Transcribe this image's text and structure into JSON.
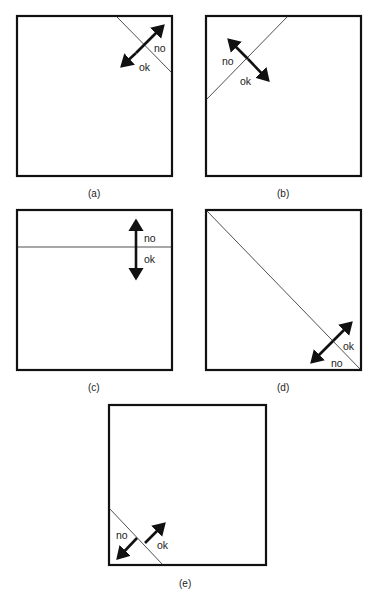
{
  "figure": {
    "panels": [
      {
        "id": "a",
        "caption": "(a)",
        "label_no": "no",
        "label_ok": "ok",
        "boundary": "diagonal line cutting top-right corner",
        "arrow": "double-headed, perpendicular to boundary"
      },
      {
        "id": "b",
        "caption": "(b)",
        "label_no": "no",
        "label_ok": "ok",
        "boundary": "diagonal line cutting top-left corner",
        "arrow": "double-headed, perpendicular to boundary"
      },
      {
        "id": "c",
        "caption": "(c)",
        "label_no": "no",
        "label_ok": "ok",
        "boundary": "horizontal line near top",
        "arrow": "double-headed vertical"
      },
      {
        "id": "d",
        "caption": "(d)",
        "label_no": "no",
        "label_ok": "ok",
        "boundary": "main diagonal from top-left to bottom-right",
        "arrow": "double-headed, perpendicular to boundary"
      },
      {
        "id": "e",
        "caption": "(e)",
        "label_no": "no",
        "label_ok": "ok",
        "boundary": "diagonal line cutting bottom-left corner",
        "arrow": "two outward arrows from boundary"
      }
    ]
  }
}
